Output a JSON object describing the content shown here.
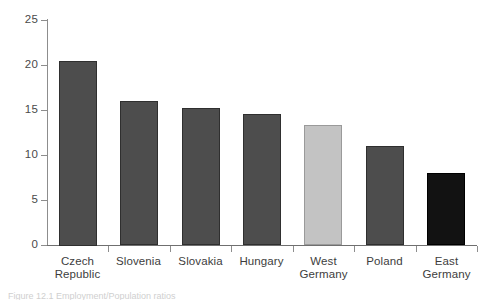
{
  "chart_data": {
    "type": "bar",
    "title": "",
    "subtitle": "",
    "xlabel": "",
    "ylabel": "",
    "ylim": [
      0,
      25
    ],
    "yticks": [
      0,
      5,
      10,
      15,
      20,
      25
    ],
    "ytick_labels": [
      "0",
      "5",
      "10",
      "15",
      "20",
      "25"
    ],
    "grid": false,
    "legend": null,
    "categories": [
      "Czech\nRepublic",
      "Slovenia",
      "Slovakia",
      "Hungary",
      "West\nGermany",
      "Poland",
      "East\nGermany"
    ],
    "values": [
      20.5,
      16.0,
      15.2,
      14.6,
      13.3,
      11.0,
      8.0
    ],
    "bar_colors": [
      "#4d4d4d",
      "#4d4d4d",
      "#4d4d4d",
      "#4d4d4d",
      "#c3c3c3",
      "#4d4d4d",
      "#121212"
    ],
    "bar_edge_colors": [
      "#2f2f2f",
      "#2f2f2f",
      "#2f2f2f",
      "#2f2f2f",
      "#9a9a9a",
      "#2f2f2f",
      "#000000"
    ],
    "axis_color": "#8d8d8d"
  },
  "caption": {
    "text": "Figure 12.1 Employment/Population ratios"
  }
}
